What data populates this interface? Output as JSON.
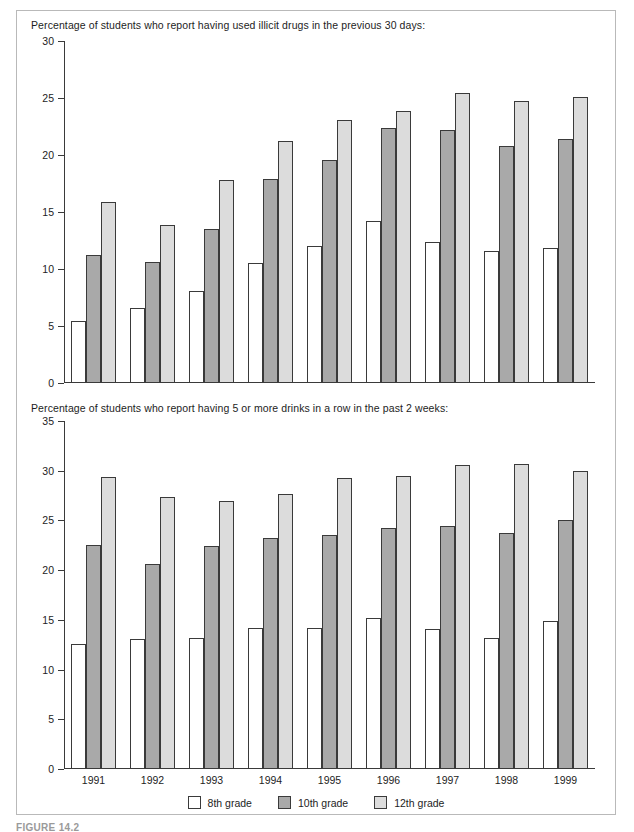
{
  "figure": {
    "caption": "FIGURE 14.2",
    "legend": [
      {
        "label": "8th grade",
        "color": "#ffffff",
        "key": "g8"
      },
      {
        "label": "10th grade",
        "color": "#a9a9a9",
        "key": "g10"
      },
      {
        "label": "12th grade",
        "color": "#dcdcdc",
        "key": "g12"
      }
    ],
    "border_color": "#b9b9b9",
    "axis_color": "#3a3a3a"
  },
  "chart_data": [
    {
      "type": "bar",
      "title": "Percentage of students who report having used illicit drugs in the previous 30 days:",
      "categories": [
        "1991",
        "1992",
        "1993",
        "1994",
        "1995",
        "1996",
        "1997",
        "1998",
        "1999"
      ],
      "series": [
        {
          "name": "8th grade",
          "color": "#ffffff",
          "values": [
            5.4,
            6.6,
            8.1,
            10.5,
            12.0,
            14.2,
            12.4,
            11.6,
            11.8
          ]
        },
        {
          "name": "10th grade",
          "color": "#a9a9a9",
          "values": [
            11.2,
            10.6,
            13.5,
            17.9,
            19.6,
            22.4,
            22.2,
            20.8,
            21.4
          ]
        },
        {
          "name": "12th grade",
          "color": "#dcdcdc",
          "values": [
            15.9,
            13.9,
            17.8,
            21.2,
            23.1,
            23.9,
            25.4,
            24.7,
            25.1
          ]
        }
      ],
      "ylim": [
        0,
        30
      ],
      "yticks": [
        0,
        5,
        10,
        15,
        20,
        25,
        30
      ],
      "xlabel": "",
      "ylabel": "",
      "grid": false,
      "legend_position": "bottom"
    },
    {
      "type": "bar",
      "title": "Percentage of students who report having 5 or more drinks in a row in the past 2 weeks:",
      "categories": [
        "1991",
        "1992",
        "1993",
        "1994",
        "1995",
        "1996",
        "1997",
        "1998",
        "1999"
      ],
      "series": [
        {
          "name": "8th grade",
          "color": "#ffffff",
          "values": [
            12.6,
            13.1,
            13.2,
            14.2,
            14.2,
            15.2,
            14.1,
            13.2,
            14.9
          ]
        },
        {
          "name": "10th grade",
          "color": "#a9a9a9",
          "values": [
            22.5,
            20.6,
            22.4,
            23.2,
            23.5,
            24.2,
            24.4,
            23.7,
            25.0
          ]
        },
        {
          "name": "12th grade",
          "color": "#dcdcdc",
          "values": [
            29.4,
            27.4,
            27.0,
            27.7,
            29.3,
            29.5,
            30.6,
            30.7,
            30.0
          ]
        }
      ],
      "ylim": [
        0,
        35
      ],
      "yticks": [
        0,
        5,
        10,
        15,
        20,
        25,
        30,
        35
      ],
      "xlabel": "",
      "ylabel": "",
      "grid": false,
      "legend_position": "bottom"
    }
  ]
}
